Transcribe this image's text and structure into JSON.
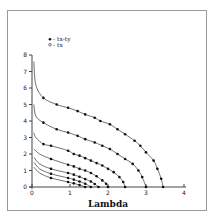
{
  "chart_data": {
    "type": "line",
    "title": "",
    "xlabel": "Lambda",
    "ylabel": "",
    "xlim": [
      0,
      4
    ],
    "ylim": [
      0,
      8
    ],
    "x_ticks": [
      "0",
      "1",
      "2",
      "3",
      "4"
    ],
    "y_ticks": [
      "0",
      "1",
      "2",
      "3",
      "4",
      "5",
      "6",
      "7",
      "8"
    ],
    "grid": false,
    "legend_position": "top-left",
    "legend": [
      {
        "marker": "filled-circle",
        "label": "tx-ty"
      },
      {
        "marker": "open-circle",
        "label": "tx"
      }
    ],
    "series": [
      {
        "name": "curve-1",
        "endpoint_lambda": 3.45,
        "plateau": 5.0,
        "points": [
          [
            0.05,
            7.6
          ],
          [
            0.1,
            6.2
          ],
          [
            0.3,
            5.4
          ],
          [
            0.65,
            5.0
          ],
          [
            0.95,
            4.8
          ],
          [
            1.2,
            4.6
          ],
          [
            1.4,
            4.4
          ],
          [
            1.65,
            4.2
          ],
          [
            1.8,
            4.0
          ],
          [
            2.05,
            3.8
          ],
          [
            2.25,
            3.5
          ],
          [
            2.45,
            3.2
          ],
          [
            2.7,
            2.8
          ],
          [
            2.85,
            2.5
          ],
          [
            3.0,
            2.1
          ],
          [
            3.2,
            1.6
          ],
          [
            3.3,
            1.1
          ],
          [
            3.4,
            0.5
          ],
          [
            3.45,
            0.0
          ]
        ]
      },
      {
        "name": "curve-2",
        "endpoint_lambda": 3.0,
        "plateau": 3.5,
        "points": [
          [
            0.05,
            5.0
          ],
          [
            0.1,
            4.3
          ],
          [
            0.3,
            3.9
          ],
          [
            0.65,
            3.5
          ],
          [
            0.95,
            3.3
          ],
          [
            1.2,
            3.1
          ],
          [
            1.4,
            2.9
          ],
          [
            1.65,
            2.7
          ],
          [
            1.85,
            2.5
          ],
          [
            2.05,
            2.3
          ],
          [
            2.25,
            2.0
          ],
          [
            2.45,
            1.7
          ],
          [
            2.65,
            1.4
          ],
          [
            2.8,
            1.0
          ],
          [
            2.9,
            0.6
          ],
          [
            3.0,
            0.0
          ]
        ]
      },
      {
        "name": "curve-3",
        "endpoint_lambda": 2.45,
        "plateau": 2.2,
        "points": [
          [
            0.05,
            3.3
          ],
          [
            0.1,
            3.0
          ],
          [
            0.3,
            2.6
          ],
          [
            0.5,
            2.5
          ],
          [
            0.95,
            2.2
          ],
          [
            1.1,
            2.0
          ],
          [
            1.25,
            1.9
          ],
          [
            1.4,
            1.75
          ],
          [
            1.55,
            1.6
          ],
          [
            1.7,
            1.45
          ],
          [
            1.85,
            1.3
          ],
          [
            2.0,
            1.1
          ],
          [
            2.15,
            0.9
          ],
          [
            2.3,
            0.6
          ],
          [
            2.4,
            0.3
          ],
          [
            2.45,
            0.0
          ]
        ]
      },
      {
        "name": "curve-4",
        "endpoint_lambda": 2.0,
        "plateau": 1.3,
        "points": [
          [
            0.05,
            2.3
          ],
          [
            0.2,
            2.0
          ],
          [
            0.5,
            1.7
          ],
          [
            0.95,
            1.35
          ],
          [
            1.1,
            1.25
          ],
          [
            1.25,
            1.1
          ],
          [
            1.4,
            1.0
          ],
          [
            1.55,
            0.85
          ],
          [
            1.7,
            0.65
          ],
          [
            1.85,
            0.4
          ],
          [
            1.95,
            0.2
          ],
          [
            2.0,
            0.0
          ]
        ]
      },
      {
        "name": "curve-5",
        "endpoint_lambda": 1.75,
        "plateau": 0.85,
        "points": [
          [
            0.05,
            1.8
          ],
          [
            0.2,
            1.4
          ],
          [
            0.5,
            1.1
          ],
          [
            0.95,
            0.85
          ],
          [
            1.1,
            0.75
          ],
          [
            1.25,
            0.62
          ],
          [
            1.4,
            0.48
          ],
          [
            1.55,
            0.33
          ],
          [
            1.65,
            0.18
          ],
          [
            1.75,
            0.0
          ]
        ]
      },
      {
        "name": "curve-6",
        "endpoint_lambda": 1.55,
        "plateau": 0.55,
        "points": [
          [
            0.05,
            1.5
          ],
          [
            0.2,
            1.1
          ],
          [
            0.5,
            0.8
          ],
          [
            0.95,
            0.55
          ],
          [
            1.1,
            0.45
          ],
          [
            1.25,
            0.33
          ],
          [
            1.4,
            0.2
          ],
          [
            1.55,
            0.0
          ]
        ]
      },
      {
        "name": "curve-7",
        "endpoint_lambda": 1.4,
        "plateau": 0.3,
        "points": [
          [
            0.05,
            1.2
          ],
          [
            0.2,
            0.85
          ],
          [
            0.5,
            0.55
          ],
          [
            0.95,
            0.3
          ],
          [
            1.1,
            0.22
          ],
          [
            1.25,
            0.12
          ],
          [
            1.4,
            0.0
          ]
        ]
      }
    ]
  }
}
